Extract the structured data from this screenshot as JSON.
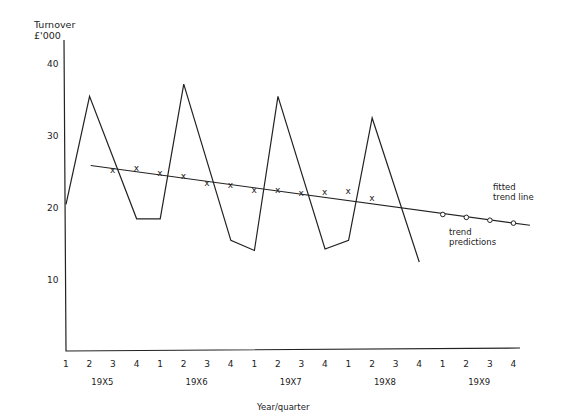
{
  "chart_data": {
    "type": "line",
    "title": "",
    "ylabel": "Turnover £'000",
    "xlabel": "Year/quarter",
    "ylim": [
      0,
      42
    ],
    "yticks": [
      10,
      20,
      30,
      40
    ],
    "grid": false,
    "quarters": [
      "1",
      "2",
      "3",
      "4",
      "1",
      "2",
      "3",
      "4",
      "1",
      "2",
      "3",
      "4",
      "1",
      "2",
      "3",
      "4",
      "1",
      "2",
      "3",
      "4"
    ],
    "years": [
      "19X5",
      "19X6",
      "19X7",
      "19X8",
      "19X9"
    ],
    "series": [
      {
        "name": "Turnover",
        "style": "line",
        "x_index": [
          0,
          1,
          3,
          4,
          5,
          7,
          8,
          9,
          11,
          12,
          13,
          15
        ],
        "values": [
          20.5,
          35.5,
          18.5,
          18.5,
          37.2,
          15.5,
          14.1,
          35.5,
          14.3,
          15.5,
          32.5,
          12.5
        ]
      },
      {
        "name": "Moving averages",
        "style": "x-markers",
        "x_index": [
          2,
          3,
          4,
          5,
          6,
          7,
          8,
          9,
          10,
          11,
          12,
          13
        ],
        "values": [
          25.3,
          25.5,
          24.9,
          24.4,
          23.5,
          23.2,
          22.5,
          22.5,
          22.1,
          22.2,
          22.4,
          21.4
        ]
      },
      {
        "name": "fitted trend line",
        "style": "straight-line",
        "x_index": [
          1.05,
          19.7
        ],
        "values": [
          25.9,
          17.6
        ]
      },
      {
        "name": "trend predictions",
        "style": "circle-markers",
        "x_index": [
          16,
          17,
          18,
          19
        ],
        "values": [
          19.1,
          18.7,
          18.3,
          17.9
        ]
      }
    ],
    "annotations": [
      {
        "text": "fitted",
        "text2": "trend line"
      },
      {
        "text": "trend",
        "text2": "predictions"
      }
    ]
  }
}
